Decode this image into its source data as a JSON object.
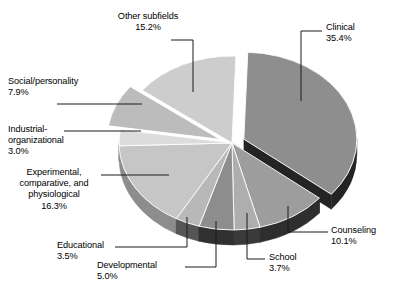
{
  "chart_data": {
    "type": "pie",
    "title": "",
    "subtitle": "",
    "xlabel": "",
    "ylabel": "",
    "legend_position": "none",
    "grid": false,
    "three_d": true,
    "units": "percent",
    "categories": [
      "Clinical",
      "Counseling",
      "School",
      "Developmental",
      "Educational",
      "Experimental, comparative, and physiological",
      "Industrial-organizational",
      "Social/personality",
      "Other subfields"
    ],
    "values": [
      35.4,
      10.1,
      3.7,
      5.0,
      3.5,
      16.3,
      3.0,
      7.9,
      15.2
    ],
    "slices": [
      {
        "id": "clinical",
        "label": "Clinical",
        "label_lines": [
          "Clinical",
          "35.4%"
        ],
        "value": 35.4,
        "value_text": "35.4%",
        "color": "#8e8e8e",
        "side_color": "#242424",
        "exploded": true
      },
      {
        "id": "counseling",
        "label": "Counseling",
        "label_lines": [
          "Counseling",
          "10.1%"
        ],
        "value": 10.1,
        "value_text": "10.1%",
        "color": "#9d9d9d",
        "side_color": "#2e2e2e",
        "exploded": false
      },
      {
        "id": "school",
        "label": "School",
        "label_lines": [
          "School",
          "3.7%"
        ],
        "value": 3.7,
        "value_text": "3.7%",
        "color": "#aeaeae",
        "side_color": "#3a3a3a",
        "exploded": false
      },
      {
        "id": "developmental",
        "label": "Developmental",
        "label_lines": [
          "Developmental",
          "5.0%"
        ],
        "value": 5.0,
        "value_text": "5.0%",
        "color": "#8d8d8d",
        "side_color": "#303030",
        "exploded": false
      },
      {
        "id": "educational",
        "label": "Educational",
        "label_lines": [
          "Educational",
          "3.5%"
        ],
        "value": 3.5,
        "value_text": "3.5%",
        "color": "#b8b8b8",
        "side_color": "#555555",
        "exploded": false
      },
      {
        "id": "experimental",
        "label": "Experimental, comparative, and physiological",
        "label_lines": [
          "Experimental,",
          "comparative, and",
          "physiological",
          "16.3%"
        ],
        "value": 16.3,
        "value_text": "16.3%",
        "color": "#c6c6c6",
        "side_color": "#8d8d8d",
        "exploded": false
      },
      {
        "id": "industrial",
        "label": "Industrial-organizational",
        "label_lines": [
          "Industrial-",
          "organizational",
          "3.0%"
        ],
        "value": 3.0,
        "value_text": "3.0%",
        "color": "#dcdcdc",
        "side_color": "#a8a8a8",
        "exploded": false
      },
      {
        "id": "social",
        "label": "Social/personality",
        "label_lines": [
          "Social/personality",
          "7.9%"
        ],
        "value": 7.9,
        "value_text": "7.9%",
        "color": "#bcbcbc",
        "side_color": "#6f6f6f",
        "exploded": true
      },
      {
        "id": "other",
        "label": "Other subfields",
        "label_lines": [
          "Other subfields",
          "15.2%"
        ],
        "value": 15.2,
        "value_text": "15.2%",
        "color": "#cdcdcd",
        "side_color": "#9a9a9a",
        "exploded": false
      }
    ]
  },
  "labels": {
    "other_subfields": "Other subfields\n15.2%",
    "clinical": "Clinical\n35.4%",
    "social": "Social/personality\n7.9%",
    "industrial": "Industrial-\norganizational\n3.0%",
    "experimental": "Experimental,\ncomparative, and\nphysiological\n16.3%",
    "educational": "Educational\n3.5%",
    "developmental": "Developmental\n5.0%",
    "school": "School\n3.7%",
    "counseling": "Counseling\n10.1%"
  },
  "colors": {
    "background": "#ffffff",
    "text": "#000000",
    "leader_line": "#1a1a1a"
  }
}
